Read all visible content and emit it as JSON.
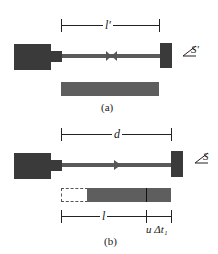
{
  "panels": {
    "a": {
      "caption": "(a)",
      "dimension_label": "l′",
      "frame_label": "S′",
      "marker": "bow-tie"
    },
    "b": {
      "caption": "(b)",
      "dimension_label": "d",
      "frame_label": "S",
      "marker": "arrowhead-right",
      "lower_dim_left_label": "l",
      "lower_dim_right_label": "u Δt₁"
    }
  },
  "colors": {
    "block": "#3a3a3a",
    "rod": "#5a5a5a",
    "bar": "#5e5e5e",
    "line": "#222222",
    "background": "#ffffff"
  }
}
